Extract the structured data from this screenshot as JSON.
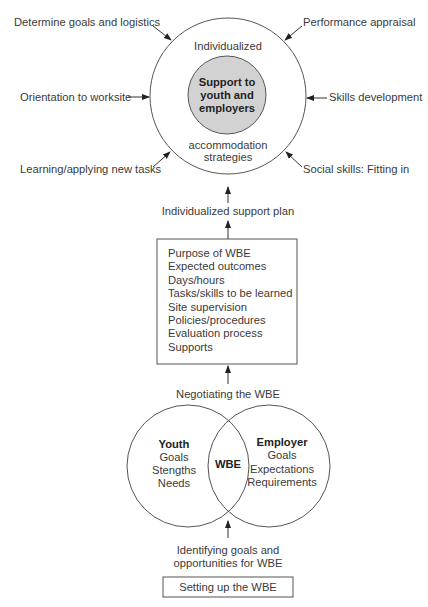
{
  "top_cycle": {
    "center_label": "Support to youth and employers",
    "center_lines": [
      "Support to",
      "youth and",
      "employers"
    ],
    "ring_top_label": "Individualized",
    "ring_bottom_lines": [
      "accommodation",
      "strategies"
    ],
    "inputs": {
      "top_left": "Determine goals and logistics",
      "top_right": "Performance appraisal",
      "mid_left": "Orientation to worksite",
      "mid_right": "Skills development",
      "bottom_left": "Learning/applying new tasks",
      "bottom_right": "Social skills: Fitting in"
    },
    "colors": {
      "center_fill": "#d2d2d2",
      "stroke": "#555555"
    }
  },
  "link_support_plan": "Individualized support plan",
  "wbe_box": {
    "items": [
      "Purpose of WBE",
      "Expected outcomes",
      "Days/hours",
      "Tasks/skills to be learned",
      "Site supervision",
      "Policies/procedures",
      "Evaluation process",
      "Supports"
    ]
  },
  "link_negotiating": "Negotiating the WBE",
  "venn": {
    "left": {
      "title": "Youth",
      "items": [
        "Goals",
        "Stengths",
        "Needs"
      ]
    },
    "overlap": "WBE",
    "right": {
      "title": "Employer",
      "items": [
        "Goals",
        "Expectations",
        "Requirements"
      ]
    }
  },
  "link_identifying_lines": [
    "Identifying goals and",
    "opportunities for WBE"
  ],
  "start_box": "Setting up the WBE"
}
